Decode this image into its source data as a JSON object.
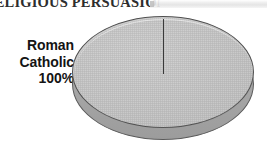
{
  "title": {
    "text": "RELIGIOUS PERSUASION",
    "clipped": true
  },
  "label": {
    "line1": "Roman",
    "line2": "Catholic",
    "line3": "100%"
  },
  "colors": {
    "background": "#ffffff",
    "slice_fill": "#c9c9c9",
    "slice_outline": "#4f4f4f",
    "side_wall": "#a8a8a8",
    "divider_line": "#3a3a3a",
    "title_text": "#2e2e2e",
    "label_text": "#141414"
  },
  "chart_data": {
    "type": "pie",
    "title": "RELIGIOUS PERSUASION",
    "three_d": true,
    "labels": [
      "Roman Catholic"
    ],
    "values": [
      100
    ],
    "value_unit": "%",
    "data_labels": [
      "Roman Catholic 100%"
    ],
    "legend": "none",
    "grid": false,
    "start_angle_deg": 90,
    "slice_count": 1,
    "colors": [
      "#c9c9c9"
    ]
  }
}
